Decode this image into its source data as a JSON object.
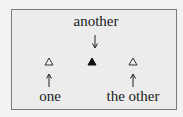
{
  "diagram": {
    "labels": {
      "top": "another",
      "bottom_left": "one",
      "bottom_right": "the other"
    },
    "markers": [
      {
        "name": "one",
        "shape": "open-triangle",
        "color": "#333333"
      },
      {
        "name": "another",
        "shape": "filled-triangle",
        "color": "#111111"
      },
      {
        "name": "the other",
        "shape": "open-triangle",
        "color": "#333333"
      }
    ],
    "arrows": [
      {
        "from": "another",
        "direction": "down"
      },
      {
        "from": "one",
        "direction": "up"
      },
      {
        "from": "the other",
        "direction": "up"
      }
    ],
    "colors": {
      "background": "#ececec",
      "border": "#7a7a7a",
      "text": "#1a1a1a"
    }
  }
}
